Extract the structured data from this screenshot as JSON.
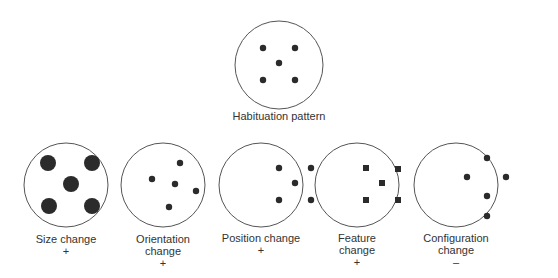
{
  "diagram": {
    "colors": {
      "stroke": "#555555",
      "fill": "#2b2b2b",
      "background": "#ffffff"
    },
    "habituation": {
      "label": "Habituation pattern",
      "circle": {
        "cx": 279,
        "cy": 65,
        "r": 44
      },
      "label_pos": {
        "x": 279,
        "y": 110
      },
      "markers": [
        {
          "shape": "dot",
          "x": 263,
          "y": 48,
          "size": 3.2
        },
        {
          "shape": "dot",
          "x": 295,
          "y": 48,
          "size": 3.2
        },
        {
          "shape": "dot",
          "x": 279,
          "y": 63,
          "size": 3.2
        },
        {
          "shape": "dot",
          "x": 263,
          "y": 80,
          "size": 3.2
        },
        {
          "shape": "dot",
          "x": 295,
          "y": 80,
          "size": 3.2
        }
      ]
    },
    "tests": [
      {
        "id": "size",
        "label_lines": [
          "Size change"
        ],
        "result": "+",
        "circle": {
          "cx": 66,
          "cy": 185,
          "r": 42
        },
        "label_pos": {
          "x": 66,
          "y": 233
        },
        "markers": [
          {
            "shape": "dot",
            "x": 48,
            "y": 163,
            "size": 8
          },
          {
            "shape": "dot",
            "x": 92,
            "y": 163,
            "size": 8
          },
          {
            "shape": "dot",
            "x": 71,
            "y": 184,
            "size": 8
          },
          {
            "shape": "dot",
            "x": 49,
            "y": 206,
            "size": 8
          },
          {
            "shape": "dot",
            "x": 92,
            "y": 206,
            "size": 8
          }
        ]
      },
      {
        "id": "orientation",
        "label_lines": [
          "Orientation",
          "change"
        ],
        "result": "+",
        "circle": {
          "cx": 163,
          "cy": 185,
          "r": 42
        },
        "label_pos": {
          "x": 163,
          "y": 233
        },
        "markers": [
          {
            "shape": "dot",
            "x": 180,
            "y": 163,
            "size": 3.2
          },
          {
            "shape": "dot",
            "x": 152,
            "y": 179,
            "size": 3.2
          },
          {
            "shape": "dot",
            "x": 175,
            "y": 184,
            "size": 3.2
          },
          {
            "shape": "dot",
            "x": 196,
            "y": 191,
            "size": 3.2
          },
          {
            "shape": "dot",
            "x": 169,
            "y": 207,
            "size": 3.2
          }
        ]
      },
      {
        "id": "position",
        "label_lines": [
          "Position change"
        ],
        "result": "+",
        "circle": {
          "cx": 261,
          "cy": 185,
          "r": 42
        },
        "label_pos": {
          "x": 261,
          "y": 232
        },
        "markers": [
          {
            "shape": "dot",
            "x": 279,
            "y": 168,
            "size": 3.2
          },
          {
            "shape": "dot",
            "x": 311,
            "y": 168,
            "size": 3.2
          },
          {
            "shape": "dot",
            "x": 295,
            "y": 183,
            "size": 3.2
          },
          {
            "shape": "dot",
            "x": 279,
            "y": 200,
            "size": 3.2
          },
          {
            "shape": "dot",
            "x": 311,
            "y": 200,
            "size": 3.2
          }
        ]
      },
      {
        "id": "feature",
        "label_lines": [
          "Feature",
          "change"
        ],
        "result": "+",
        "circle": {
          "cx": 357,
          "cy": 185,
          "r": 42
        },
        "label_pos": {
          "x": 357,
          "y": 232
        },
        "markers": [
          {
            "shape": "square",
            "x": 366,
            "y": 168,
            "size": 6
          },
          {
            "shape": "square",
            "x": 398,
            "y": 169,
            "size": 6
          },
          {
            "shape": "square",
            "x": 382,
            "y": 183,
            "size": 6
          },
          {
            "shape": "square",
            "x": 366,
            "y": 200,
            "size": 6
          },
          {
            "shape": "square",
            "x": 398,
            "y": 200,
            "size": 6
          }
        ]
      },
      {
        "id": "configuration",
        "label_lines": [
          "Configuration",
          "change"
        ],
        "result": "–",
        "circle": {
          "cx": 456,
          "cy": 185,
          "r": 42
        },
        "label_pos": {
          "x": 456,
          "y": 232
        },
        "markers": [
          {
            "shape": "dot",
            "x": 487,
            "y": 158,
            "size": 3.2
          },
          {
            "shape": "dot",
            "x": 467,
            "y": 177,
            "size": 3.2
          },
          {
            "shape": "dot",
            "x": 506,
            "y": 177,
            "size": 3.2
          },
          {
            "shape": "dot",
            "x": 487,
            "y": 196,
            "size": 3.2
          },
          {
            "shape": "dot",
            "x": 487,
            "y": 216,
            "size": 3.2
          }
        ]
      }
    ]
  },
  "text": {
    "habituation_label": "Habituation pattern",
    "size_label": "Size change",
    "size_result": "+",
    "orientation_label_1": "Orientation",
    "orientation_label_2": "change",
    "orientation_result": "+",
    "position_label": "Position change",
    "position_result": "+",
    "feature_label_1": "Feature",
    "feature_label_2": "change",
    "feature_result": "+",
    "configuration_label_1": "Configuration",
    "configuration_label_2": "change",
    "configuration_result": "–"
  }
}
